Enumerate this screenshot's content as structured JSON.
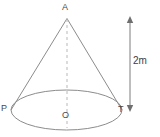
{
  "figure": {
    "shape": "cone",
    "stroke_color": "#8c8c8c",
    "dashed_color": "#b4b4b4",
    "dimension_color": "#7a7a7a",
    "background_color": "#ffffff",
    "text_color": "#4a4a4a"
  },
  "labels": {
    "apex": "A",
    "base_left": "P",
    "base_right": "T",
    "base_center": "O",
    "dimension": "2m"
  },
  "geometry": {
    "apex": {
      "x": 67,
      "y": 18
    },
    "base_center": {
      "x": 66.5,
      "y": 110
    },
    "base_rx": 56,
    "base_ry": 20,
    "base_left_point": {
      "x": 11,
      "y": 110
    },
    "base_right_point": {
      "x": 122,
      "y": 110
    },
    "axis_top": {
      "x": 67,
      "y": 19
    },
    "axis_bottom": {
      "x": 67,
      "y": 128
    },
    "dimension_line": {
      "x": 130,
      "y_top": 17,
      "y_bottom": 111
    }
  }
}
